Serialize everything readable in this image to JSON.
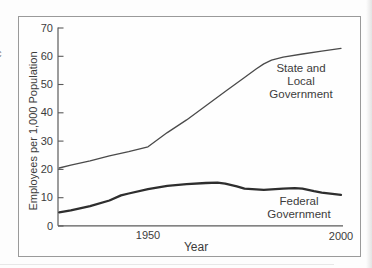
{
  "artifacts": {
    "edge_glyph": "c"
  },
  "chart_data": {
    "type": "line",
    "title": "",
    "xlabel": "Year",
    "ylabel": "Employees per 1,000 Population",
    "x_axis": {
      "min": 1926.5,
      "max": 2000.5,
      "labeled_ticks": [
        1950,
        2000
      ],
      "tick_marks_visible": false
    },
    "y_axis": {
      "min": 0,
      "max": 70,
      "ticks": [
        0,
        10,
        20,
        30,
        40,
        50,
        60,
        70
      ],
      "tick_marks_visible": true
    },
    "grid": false,
    "legend_position": "inline-annotations",
    "series": [
      {
        "name": "State and Local Government",
        "label_lines": [
          "State and Local",
          "Government"
        ],
        "color": "#4a4a4a",
        "stroke_width": 1.3,
        "points": [
          [
            1927,
            20.5
          ],
          [
            1930,
            21.5
          ],
          [
            1935,
            23.0
          ],
          [
            1940,
            24.8
          ],
          [
            1945,
            26.3
          ],
          [
            1950,
            28.0
          ],
          [
            1955,
            33.0
          ],
          [
            1960,
            37.5
          ],
          [
            1965,
            42.5
          ],
          [
            1970,
            47.5
          ],
          [
            1975,
            52.5
          ],
          [
            1978,
            55.5
          ],
          [
            1980,
            57.3
          ],
          [
            1982,
            58.6
          ],
          [
            1985,
            59.7
          ],
          [
            1990,
            60.8
          ],
          [
            1995,
            61.8
          ],
          [
            2000,
            62.8
          ]
        ]
      },
      {
        "name": "Federal Government",
        "label_lines": [
          "Federal",
          "Government"
        ],
        "color": "#2e2e2e",
        "stroke_width": 2.3,
        "points": [
          [
            1927,
            4.8
          ],
          [
            1930,
            5.5
          ],
          [
            1935,
            7.0
          ],
          [
            1940,
            9.0
          ],
          [
            1943,
            10.8
          ],
          [
            1945,
            11.5
          ],
          [
            1950,
            13.0
          ],
          [
            1955,
            14.2
          ],
          [
            1960,
            14.8
          ],
          [
            1965,
            15.2
          ],
          [
            1968,
            15.3
          ],
          [
            1970,
            15.0
          ],
          [
            1973,
            14.0
          ],
          [
            1975,
            13.2
          ],
          [
            1980,
            12.8
          ],
          [
            1985,
            13.2
          ],
          [
            1988,
            13.4
          ],
          [
            1990,
            13.2
          ],
          [
            1993,
            12.3
          ],
          [
            1995,
            11.8
          ],
          [
            2000,
            11.0
          ]
        ]
      }
    ],
    "x_tick_labels": {
      "t1950": "1950",
      "t2000": "2000"
    }
  },
  "labels": {
    "xlabel": "Year",
    "ylabel": "Employees per 1,000 Population",
    "state_line1": "State and Local",
    "state_line2": "Government",
    "federal_line1": "Federal",
    "federal_line2": "Government"
  }
}
